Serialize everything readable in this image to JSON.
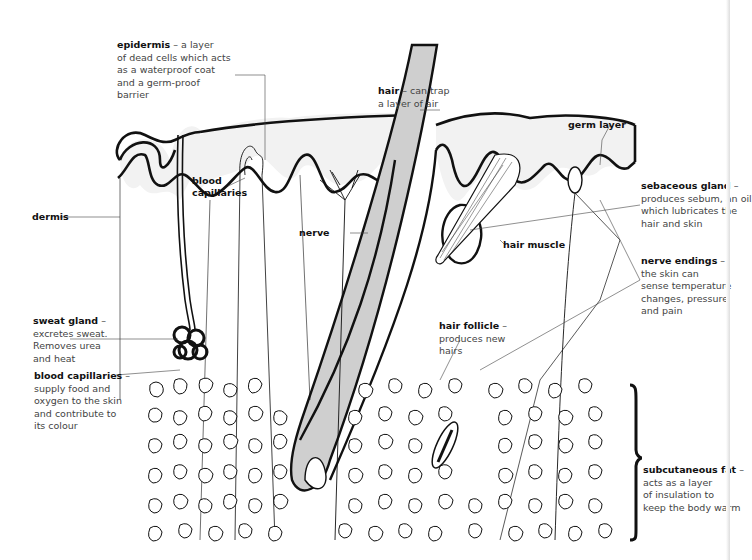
{
  "diagram": {
    "colors": {
      "outline": "#111111",
      "hair_fill": "#cfcfcf",
      "epidermis_fill": "#f2f2f2",
      "label_text": "#444444",
      "label_title": "#111111"
    }
  },
  "labels": {
    "epidermis": {
      "title": "epidermis",
      "desc_lines": [
        "– a layer",
        "of dead cells which acts",
        "as a waterproof coat",
        "and a germ-proof",
        "barrier"
      ]
    },
    "hair": {
      "title": "hair",
      "desc_lines": [
        "– can trap",
        "a layer of air"
      ]
    },
    "germ_layer": {
      "title": "germ layer"
    },
    "blood_capillaries_top": {
      "title_lines": [
        "blood",
        "capillaries"
      ]
    },
    "nerve": {
      "title": "nerve"
    },
    "dermis": {
      "title": "dermis"
    },
    "hair_muscle": {
      "title": "hair muscle"
    },
    "sebaceous_gland": {
      "title": "sebaceous gland",
      "desc_lines": [
        "–",
        "produces sebum, an oil",
        "which lubricates the",
        "hair and skin"
      ]
    },
    "nerve_endings": {
      "title": "nerve endings",
      "desc_lines": [
        "–",
        "the skin can",
        "sense temperature",
        "changes, pressure",
        "and pain"
      ]
    },
    "sweat_gland": {
      "title": "sweat gland",
      "desc_lines": [
        "–",
        "excretes sweat.",
        "Removes urea",
        "and heat"
      ]
    },
    "blood_capillaries_side": {
      "title": "blood capillaries",
      "desc_lines": [
        "–",
        "supply food and",
        "oxygen to the skin",
        "and contribute to",
        "its colour"
      ]
    },
    "hair_follicle": {
      "title": "hair follicle",
      "desc_lines": [
        "–",
        "produces new",
        "hairs"
      ]
    },
    "subcutaneous_fat": {
      "title": "subcutaneous fat",
      "desc_lines": [
        "–",
        "acts as a layer",
        "of insulation to",
        "keep the body warm"
      ]
    }
  }
}
